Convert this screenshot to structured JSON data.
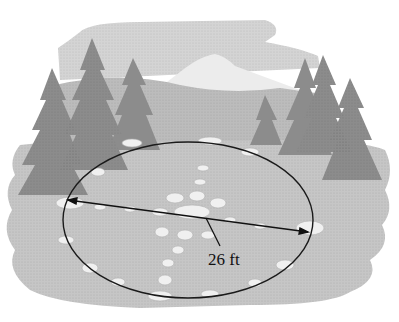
{
  "figure": {
    "measurement": {
      "label": "26 ft",
      "quantity": "diameter",
      "value": 26,
      "unit": "ft"
    },
    "colors": {
      "sky": "#d9d9d9",
      "mountain": "#e6e6e6",
      "hills": "#bdbdbd",
      "trees": "#8f8f8f",
      "ground": "#c8c8c8",
      "stones": "#f2f2f2",
      "outline": "#1a1a1a"
    }
  }
}
